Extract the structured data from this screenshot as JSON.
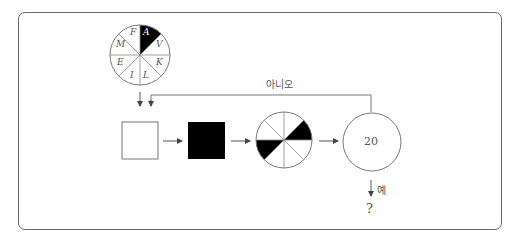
{
  "diagram": {
    "wheel": {
      "letters": [
        "A",
        "V",
        "K",
        "L",
        "I",
        "E",
        "M",
        "F"
      ],
      "shaded_letter": "A"
    },
    "steps": [
      {
        "type": "square",
        "fill": "white"
      },
      {
        "type": "square",
        "fill": "black"
      },
      {
        "type": "circle-sectors",
        "sectors": 8,
        "shaded": [
          "upper-right",
          "lower-left"
        ]
      },
      {
        "type": "circle-counter",
        "value": "20"
      }
    ],
    "loop_label": "아니오",
    "exit_label": "예",
    "result": "?",
    "colors": {
      "line": "#6a6a6a",
      "fill_dark": "#000000",
      "text": "#555555"
    }
  }
}
